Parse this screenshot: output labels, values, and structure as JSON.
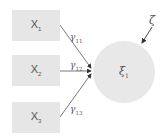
{
  "diagram": {
    "type": "path-diagram",
    "exogenous": [
      {
        "name": "X",
        "sub": "1"
      },
      {
        "name": "X",
        "sub": "2"
      },
      {
        "name": "X",
        "sub": "3"
      }
    ],
    "latent": {
      "name": "ξ",
      "sub": "1"
    },
    "disturbance": {
      "name": "ζ"
    },
    "paths": [
      {
        "name": "γ",
        "sub": "11"
      },
      {
        "name": "γ",
        "sub": "12"
      },
      {
        "name": "γ",
        "sub": "13"
      }
    ],
    "colors": {
      "box": "#e6e6e6",
      "circle": "#e8e8e8",
      "line": "#555555",
      "text": "#555555"
    }
  }
}
